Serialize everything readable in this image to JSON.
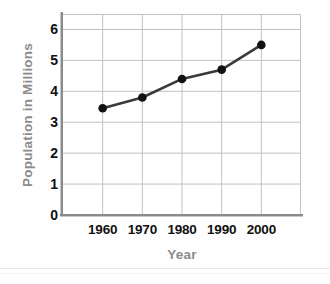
{
  "chart_data": {
    "type": "line",
    "title": "",
    "xlabel": "Year",
    "ylabel": "Population in Millions",
    "x": [
      1960,
      1970,
      1980,
      1990,
      2000
    ],
    "categories": [
      "1960",
      "1970",
      "1980",
      "1990",
      "2000"
    ],
    "values": [
      3.45,
      3.8,
      4.4,
      4.7,
      5.5
    ],
    "series": [
      {
        "name": "Population",
        "values": [
          3.45,
          3.8,
          4.4,
          4.7,
          5.5
        ]
      }
    ],
    "xlim": [
      1950,
      2010
    ],
    "ylim": [
      0,
      6.5
    ],
    "ytick_labels": [
      "0",
      "1",
      "2",
      "3",
      "4",
      "5",
      "6"
    ],
    "ytick_values": [
      0,
      1,
      2,
      3,
      4,
      5,
      6
    ],
    "xtick_labels": [
      "1960",
      "1970",
      "1980",
      "1990",
      "2000"
    ],
    "xtick_values": [
      1960,
      1970,
      1980,
      1990,
      2000
    ],
    "grid": true,
    "legend": "none",
    "marker": "circle",
    "colors": {
      "line": "#3a3a3a",
      "marker": "#111111",
      "grid": "#c2c2c2",
      "spine": "#8a8a8a",
      "tick_label": "#111111",
      "axis_title": "#8c8c8c",
      "plot_background": "#ffffff",
      "figure_background": "#fefefe"
    }
  },
  "axes": {
    "y_title": "Population in Millions",
    "x_title": "Year"
  }
}
